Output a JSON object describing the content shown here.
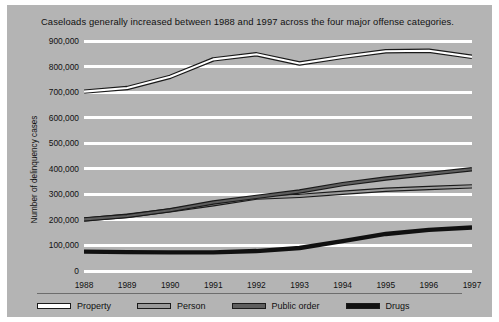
{
  "figure": {
    "title": "Caseloads generally increased between 1988 and 1997 across the four major offense categories.",
    "background_color": "#b4b4b4",
    "gridline_color": "#ffffff",
    "page_background": "#ffffff"
  },
  "chart_data": {
    "type": "line",
    "title": "Caseloads generally increased between 1988 and 1997 across the four major offense categories.",
    "xlabel": "",
    "ylabel": "Number of delinquency cases",
    "categories": [
      "1988",
      "1989",
      "1990",
      "1991",
      "1992",
      "1993",
      "1994",
      "1995",
      "1996",
      "1997"
    ],
    "x": [
      1988,
      1989,
      1990,
      1991,
      1992,
      1993,
      1994,
      1995,
      1996,
      1997
    ],
    "ylim": [
      0,
      900000
    ],
    "yticks": [
      0,
      100000,
      200000,
      300000,
      400000,
      500000,
      600000,
      700000,
      800000,
      900000
    ],
    "ytick_labels": [
      "0",
      "100,000",
      "200,000",
      "300,000",
      "400,000",
      "500,000",
      "600,000",
      "700,000",
      "800,000",
      "900,000"
    ],
    "grid": true,
    "legend_position": "bottom",
    "series": [
      {
        "name": "Property",
        "color": "#ffffff",
        "outline": "#1a1a1a",
        "values": [
          702000,
          716000,
          760000,
          828000,
          848000,
          812000,
          838000,
          860000,
          862000,
          838000
        ]
      },
      {
        "name": "Person",
        "color": "#9a9a9a",
        "outline": "#1a1a1a",
        "values": [
          201000,
          216000,
          237000,
          261000,
          287000,
          294000,
          306000,
          318000,
          325000,
          331000
        ]
      },
      {
        "name": "Public order",
        "color": "#5e5e5e",
        "outline": "#1a1a1a",
        "values": [
          202000,
          215000,
          238000,
          268000,
          290000,
          311000,
          340000,
          362000,
          380000,
          398000
        ]
      },
      {
        "name": "Drugs",
        "color": "#111111",
        "outline": "#111111",
        "values": [
          76000,
          74000,
          73000,
          73000,
          78000,
          90000,
          117000,
          145000,
          161000,
          170000
        ]
      }
    ]
  },
  "legend": {
    "items": [
      {
        "label": "Property",
        "color": "#ffffff"
      },
      {
        "label": "Person",
        "color": "#9a9a9a"
      },
      {
        "label": "Public order",
        "color": "#5e5e5e"
      },
      {
        "label": "Drugs",
        "color": "#111111"
      }
    ]
  }
}
